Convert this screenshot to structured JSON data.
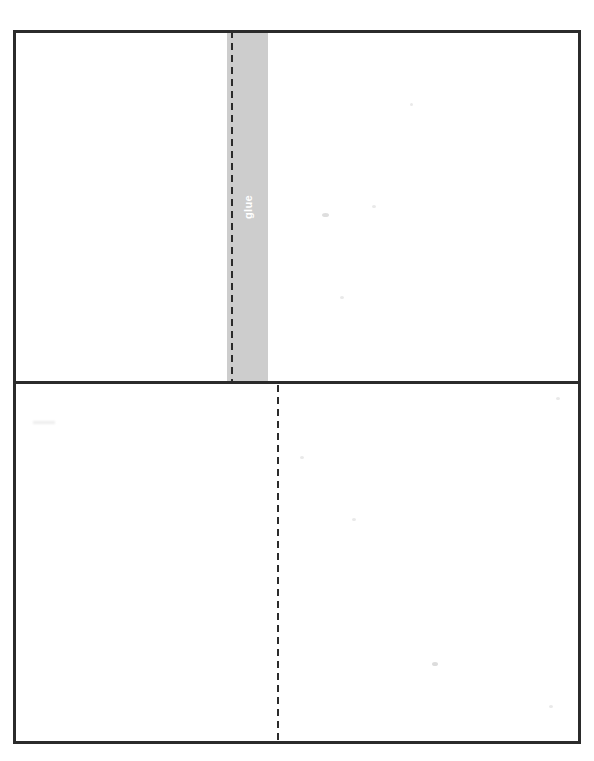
{
  "document": {
    "type": "scanned-foldable-template",
    "title": "Foldable Paper Template",
    "background_color": "#ffffff",
    "page_width": 594,
    "page_height": 761
  },
  "frame": {
    "label": "template-outline",
    "border_color": "#2b2b2b",
    "border_width": 3,
    "left": 13,
    "top": 30,
    "width": 568,
    "height": 714
  },
  "divider": {
    "label": "horizontal-crease",
    "color": "#2b2b2b",
    "thickness": 3,
    "top": 381
  },
  "glue_strip": {
    "label": "glue",
    "text": "glue",
    "text_color": "#ffffff",
    "fill_color": "#cdcdcd",
    "rotation_degrees": 180,
    "left": 227,
    "top": 33,
    "width": 41,
    "height": 348
  },
  "fold_lines": [
    {
      "name": "upper-fold-line",
      "color": "#2b2b2b",
      "style": "dashed",
      "orientation": "vertical",
      "x": 231,
      "top": 31,
      "height": 351,
      "dash_length": 7,
      "gap_length": 5
    },
    {
      "name": "lower-fold-line",
      "color": "#2b2b2b",
      "style": "dashed",
      "orientation": "vertical",
      "x": 277,
      "top": 385,
      "height": 359,
      "dash_length": 7,
      "gap_length": 5
    }
  ],
  "panels": [
    {
      "name": "upper-left-panel"
    },
    {
      "name": "upper-right-panel"
    },
    {
      "name": "lower-left-panel"
    },
    {
      "name": "lower-right-panel"
    }
  ],
  "artifacts": [
    {
      "name": "smudge-left-upper",
      "left": 33,
      "top": 421,
      "width": 22,
      "height": 3
    },
    {
      "name": "speck-center-upper",
      "left": 322,
      "top": 213,
      "width": 7,
      "height": 4
    },
    {
      "name": "speck-upper-right",
      "left": 410,
      "top": 103,
      "width": 3,
      "height": 3
    },
    {
      "name": "speck-mid-right",
      "left": 372,
      "top": 205,
      "width": 4,
      "height": 3
    },
    {
      "name": "speck-mid-low",
      "left": 340,
      "top": 296,
      "width": 4,
      "height": 3
    },
    {
      "name": "speck-lower-left",
      "left": 300,
      "top": 456,
      "width": 4,
      "height": 3
    },
    {
      "name": "speck-lower-mid",
      "left": 352,
      "top": 518,
      "width": 4,
      "height": 3
    },
    {
      "name": "speck-lower-right",
      "left": 432,
      "top": 662,
      "width": 6,
      "height": 4
    },
    {
      "name": "speck-right-edge",
      "left": 556,
      "top": 397,
      "width": 4,
      "height": 3
    },
    {
      "name": "speck-right-low",
      "left": 549,
      "top": 705,
      "width": 4,
      "height": 3
    }
  ]
}
